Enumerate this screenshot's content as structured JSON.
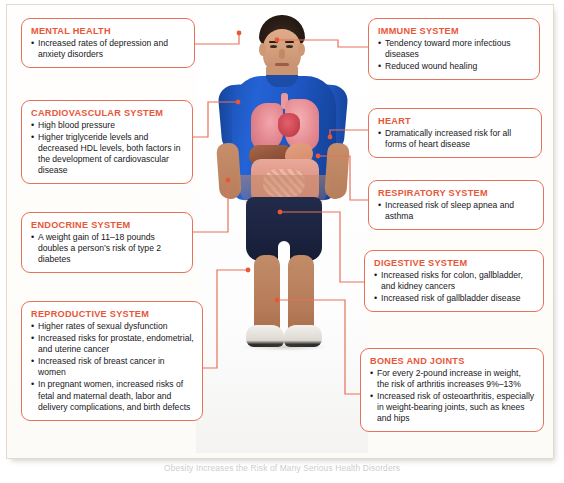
{
  "figure": {
    "accent_border": "#e8715a",
    "accent_title": "#e8573a",
    "text_color": "#18171a",
    "caption": "Obesity Increases the Risk of Many Serious Health Disorders"
  },
  "subject": {
    "description": "Adult male subject with anatomical organ overlay",
    "shirt_color": "#1f57c4",
    "shorts_color": "#1b2340",
    "shoe_color": "#f2f0ec",
    "organs": [
      {
        "name": "trachea",
        "color": "#e79aa0"
      },
      {
        "name": "left-lung",
        "color": "#e1848c"
      },
      {
        "name": "right-lung",
        "color": "#e68d94"
      },
      {
        "name": "heart",
        "color": "#c94652"
      },
      {
        "name": "liver",
        "color": "#8e5137"
      },
      {
        "name": "stomach",
        "color": "#d48a68"
      },
      {
        "name": "large-intestine",
        "color": "#dd9283"
      },
      {
        "name": "small-intestine",
        "color": "#e09e8e"
      },
      {
        "name": "bladder",
        "color": "#d7b07f"
      }
    ]
  },
  "callouts": [
    {
      "id": "mental",
      "title": "MENTAL HEALTH",
      "items": [
        "Increased rates of depression and anxiety disorders"
      ]
    },
    {
      "id": "cardiovascular",
      "title": "CARDIOVASCULAR SYSTEM",
      "items": [
        "High blood pressure",
        "Higher triglyceride levels and decreased HDL levels,  both factors in the development of cardiovascular disease"
      ]
    },
    {
      "id": "endocrine",
      "title": "ENDOCRINE SYSTEM",
      "items": [
        "A weight gain of 11–18 pounds doubles a person’s risk of type 2 diabetes"
      ]
    },
    {
      "id": "reproductive",
      "title": "REPRODUCTIVE SYSTEM",
      "items": [
        "Higher rates of sexual dysfunction",
        "Increased risks for prostate, endometrial, and uterine cancer",
        "Increased risk of breast cancer in women",
        "In pregnant women,  increased risks of fetal and maternal death, labor and delivery complications, and birth defects"
      ]
    },
    {
      "id": "immune",
      "title": "IMMUNE SYSTEM",
      "items": [
        "Tendency toward more infectious diseases",
        "Reduced wound healing"
      ]
    },
    {
      "id": "heart",
      "title": "HEART",
      "items": [
        "Dramatically increased risk for all forms of heart disease"
      ]
    },
    {
      "id": "respiratory",
      "title": "RESPIRATORY SYSTEM",
      "items": [
        "Increased risk of sleep apnea and asthma"
      ]
    },
    {
      "id": "digestive",
      "title": "DIGESTIVE SYSTEM",
      "items": [
        "Increased risks for colon, gallbladder,  and kidney cancers",
        "Increased risk of gallbladder disease"
      ]
    },
    {
      "id": "bones",
      "title": "BONES AND JOINTS",
      "items": [
        "For every 2-pound increase in weight,  the risk of arthritis increases 9%–13%",
        "Increased risk of osteoarthritis, especially in weight-bearing joints, such as knees and hips"
      ]
    }
  ]
}
